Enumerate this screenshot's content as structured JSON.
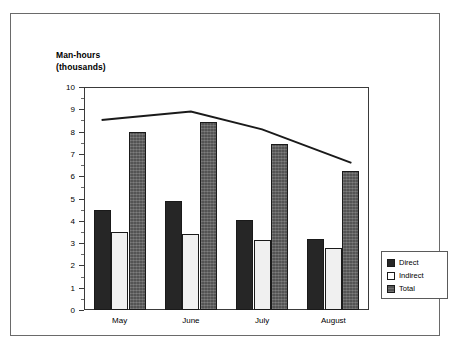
{
  "chart_data": {
    "type": "bar",
    "title": "Man-hours",
    "subtitle": "(thousands)",
    "xlabel": "",
    "ylabel": "",
    "ylim": [
      0,
      10
    ],
    "ytick_step": 1,
    "yticks": [
      "0",
      "1",
      "2",
      "3",
      "4",
      "5",
      "6",
      "7",
      "8",
      "9",
      "10"
    ],
    "minor_ticks": true,
    "grid": false,
    "legend_position": "bottom-right-inside",
    "categories": [
      "May",
      "June",
      "July",
      "August"
    ],
    "series": [
      {
        "name": "Direct",
        "type": "bar",
        "color": "#262626",
        "values": [
          4.5,
          4.9,
          4.05,
          3.2
        ]
      },
      {
        "name": "Indirect",
        "type": "bar",
        "color": "#f0f0f0",
        "values": [
          3.5,
          3.4,
          3.15,
          2.8
        ]
      },
      {
        "name": "Total",
        "type": "bar",
        "color": "#545454",
        "values": [
          8.0,
          8.45,
          7.45,
          6.25
        ]
      },
      {
        "name": "Trend",
        "type": "line",
        "color": "#1a1a1a",
        "values": [
          8.6,
          8.9,
          8.1,
          6.9
        ]
      }
    ]
  },
  "legend": {
    "items": [
      {
        "label": "Direct"
      },
      {
        "label": "Indirect"
      },
      {
        "label": "Total"
      }
    ]
  },
  "colors": {
    "direct": "#262626",
    "indirect": "#f0f0f0",
    "total": "#545454",
    "line": "#1a1a1a",
    "frame": "#6a6a6a",
    "axis": "#3a3a3a"
  }
}
